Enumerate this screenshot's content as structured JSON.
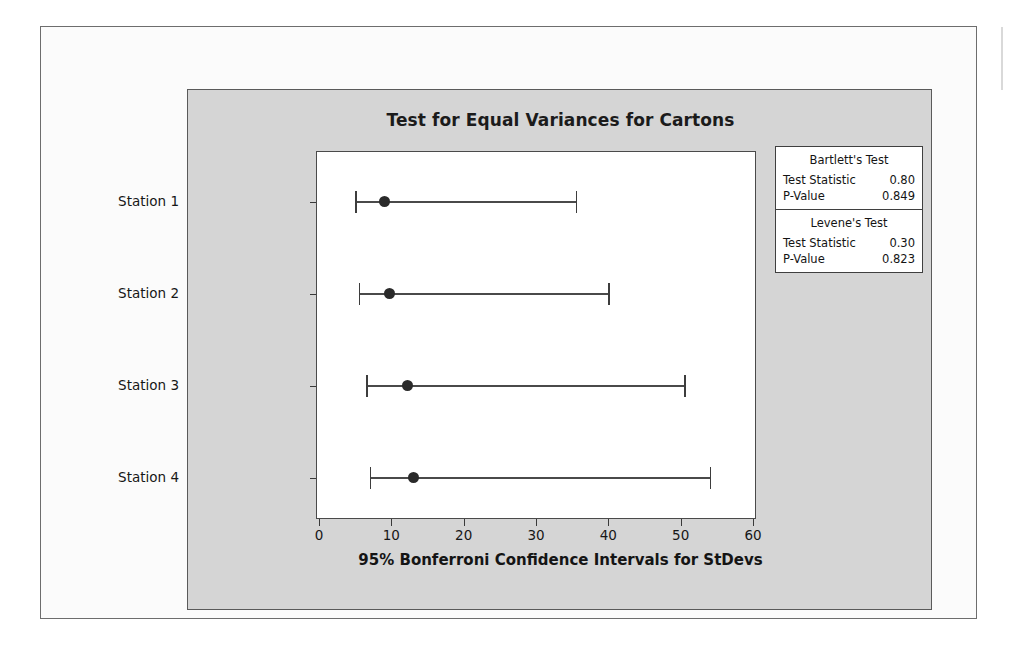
{
  "chart_data": {
    "type": "scatter",
    "title": "Test for Equal Variances for Cartons",
    "xlabel": "95% Bonferroni Confidence Intervals for StDevs",
    "ylabel": "",
    "xlim": [
      0,
      60
    ],
    "xticks": [
      0,
      10,
      20,
      30,
      40,
      50,
      60
    ],
    "grid": false,
    "legend": false,
    "categories": [
      "Station 1",
      "Station 2",
      "Station 3",
      "Station 4"
    ],
    "series": [
      {
        "name": "95% Bonferroni CI for StDev",
        "points": [
          {
            "category": "Station 1",
            "center": 9.0,
            "lower": 5.0,
            "upper": 35.5
          },
          {
            "category": "Station 2",
            "center": 9.8,
            "lower": 5.5,
            "upper": 40.0
          },
          {
            "category": "Station 3",
            "center": 12.3,
            "lower": 6.5,
            "upper": 50.5
          },
          {
            "category": "Station 4",
            "center": 13.0,
            "lower": 7.0,
            "upper": 54.0
          }
        ]
      }
    ]
  },
  "stats": {
    "sections": [
      {
        "heading": "Bartlett's Test",
        "rows": [
          {
            "label": "Test Statistic",
            "value": "0.80"
          },
          {
            "label": "P-Value",
            "value": "0.849"
          }
        ]
      },
      {
        "heading": "Levene's Test",
        "rows": [
          {
            "label": "Test Statistic",
            "value": "0.30"
          },
          {
            "label": "P-Value",
            "value": "0.823"
          }
        ]
      }
    ]
  }
}
